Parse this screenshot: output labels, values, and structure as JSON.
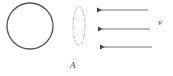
{
  "diagram": {
    "shapes": [
      {
        "type": "circle",
        "style": "solid",
        "cx": 30,
        "cy": 26,
        "r": 23
      },
      {
        "type": "ellipse",
        "style": "dotted",
        "cx": 79,
        "cy": 26,
        "rx": 6,
        "ry": 19
      },
      {
        "type": "arrow",
        "direction": "left",
        "y": 10
      },
      {
        "type": "arrow",
        "direction": "left",
        "y": 29
      },
      {
        "type": "arrow",
        "direction": "left",
        "y": 47
      }
    ],
    "labels": {
      "velocity": "v",
      "surface": "A"
    },
    "colors": {
      "stroke": "#444444",
      "dotted": "#999999"
    }
  }
}
